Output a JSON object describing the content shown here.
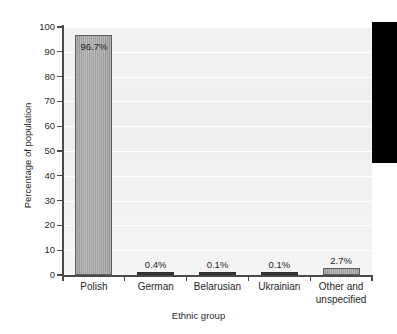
{
  "chart_data": {
    "type": "bar",
    "title": "",
    "subtitle": "",
    "xlabel": "Ethnic group",
    "ylabel": "Percentage of population",
    "categories": [
      "Polish",
      "German",
      "Belarusian",
      "Ukrainian",
      "Other and unspecified"
    ],
    "values": [
      96.7,
      0.4,
      0.1,
      0.1,
      2.7
    ],
    "value_labels": [
      "96.7%",
      "0.4%",
      "0.1%",
      "0.1%",
      "2.7%"
    ],
    "ylim": [
      0,
      100
    ],
    "y_ticks": [
      0,
      10,
      20,
      30,
      40,
      50,
      60,
      70,
      80,
      90,
      100
    ],
    "y_tick_labels": [
      "0",
      "10",
      "20",
      "30",
      "40",
      "50",
      "60",
      "70",
      "80",
      "90",
      "100"
    ],
    "grid": true,
    "legend": "none",
    "bar_fill_color": "#a5a5a5",
    "bar_edge_color": "#5d5d5d",
    "plot_background_color": "#f1f1f1",
    "gridline_color": "#ffffff",
    "axis_color": "#4a4a4a",
    "text_color": "#1f1f1f"
  },
  "category_lines": [
    [
      "Polish"
    ],
    [
      "German"
    ],
    [
      "Belarusian"
    ],
    [
      "Ukrainian"
    ],
    [
      "Other and",
      "unspecified"
    ]
  ],
  "artifact": {
    "name": "scan-edge-artifact",
    "color": "#010101"
  }
}
